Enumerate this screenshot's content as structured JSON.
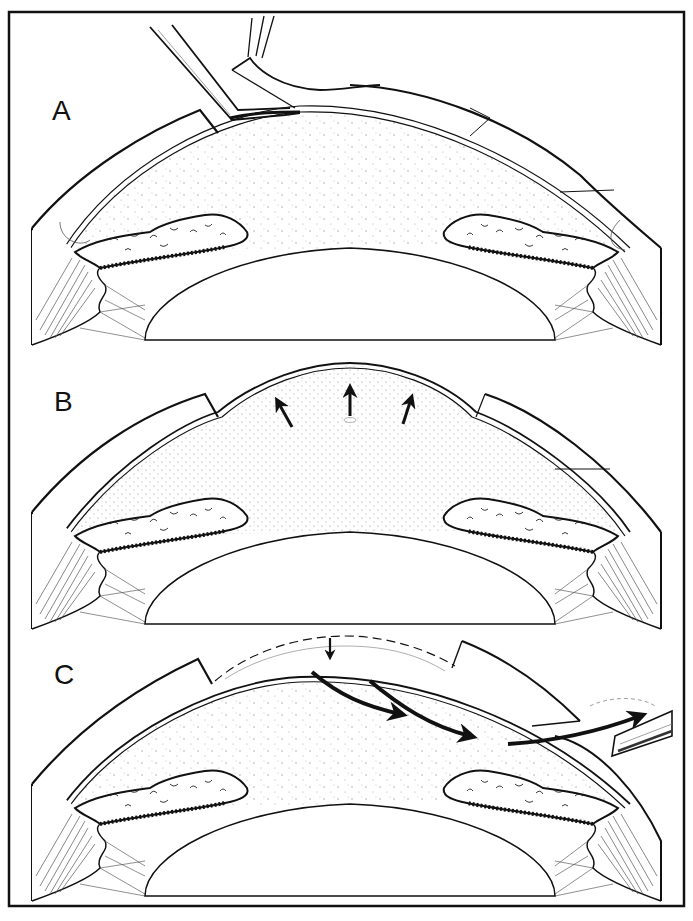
{
  "figure": {
    "panels": [
      {
        "id": "A",
        "label": "A"
      },
      {
        "id": "B",
        "label": "B"
      },
      {
        "id": "C",
        "label": "C"
      }
    ],
    "colors": {
      "ink": "#111111",
      "background": "#ffffff",
      "stipple": "#9a9a9a"
    }
  }
}
